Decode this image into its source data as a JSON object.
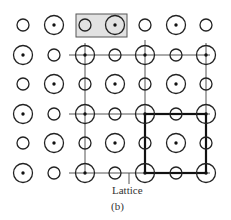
{
  "figure": {
    "label_lattice": "Lattice",
    "caption": "(b)"
  },
  "grid": {
    "cols_x": [
      23,
      54,
      85,
      115,
      145,
      176,
      206
    ],
    "rows_y": [
      25,
      55,
      84,
      114,
      143,
      173
    ],
    "pattern": "alternating large-dotted and small-hollow circles; row 1 starts with small"
  },
  "colors": {
    "stroke": "#222222",
    "highlight_fill": "#e0e0e0",
    "thin_line": "#555555"
  },
  "highlight_box": {
    "x": 76,
    "y": 14,
    "w": 51,
    "h": 23,
    "contents": [
      "small circle",
      "large dotted circle"
    ]
  },
  "unit_cell": {
    "x1": 145,
    "y1": 114,
    "x2": 206,
    "y2": 173
  }
}
